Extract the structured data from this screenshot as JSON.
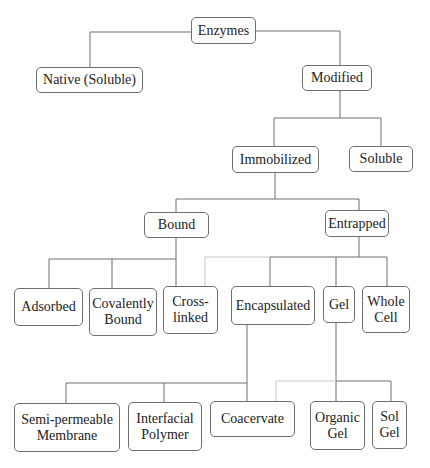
{
  "diagram": {
    "line_color": "#6e6e6e",
    "light_line_color": "#c8c8c8",
    "nodes": {
      "enzymes": "Enzymes",
      "native": "Native (Soluble)",
      "modified": "Modified",
      "immobilized": "Immobilized",
      "soluble": "Soluble",
      "bound": "Bound",
      "entrapped": "Entrapped",
      "adsorbed": "Adsorbed",
      "covalently_bound": "Covalently\nBound",
      "cross_linked": "Cross-\nlinked",
      "encapsulated": "Encapsulated",
      "gel": "Gel",
      "whole_cell": "Whole\nCell",
      "semi_permeable": "Semi-permeable\nMembrane",
      "interfacial": "Interfacial\nPolymer",
      "coacervate": "Coacervate",
      "organic_gel": "Organic\nGel",
      "sol_gel": "Sol\nGel"
    },
    "edges": [
      [
        "Enzymes",
        "Native (Soluble)"
      ],
      [
        "Enzymes",
        "Modified"
      ],
      [
        "Modified",
        "Immobilized"
      ],
      [
        "Modified",
        "Soluble"
      ],
      [
        "Immobilized",
        "Bound"
      ],
      [
        "Immobilized",
        "Entrapped"
      ],
      [
        "Bound",
        "Adsorbed"
      ],
      [
        "Bound",
        "Covalently Bound"
      ],
      [
        "Bound",
        "Cross-linked"
      ],
      [
        "Entrapped",
        "Cross-linked"
      ],
      [
        "Entrapped",
        "Encapsulated"
      ],
      [
        "Entrapped",
        "Gel"
      ],
      [
        "Entrapped",
        "Whole Cell"
      ],
      [
        "Encapsulated",
        "Semi-permeable Membrane"
      ],
      [
        "Encapsulated",
        "Interfacial Polymer"
      ],
      [
        "Encapsulated",
        "Coacervate"
      ],
      [
        "Gel",
        "Coacervate"
      ],
      [
        "Gel",
        "Organic Gel"
      ],
      [
        "Gel",
        "Sol Gel"
      ]
    ]
  }
}
